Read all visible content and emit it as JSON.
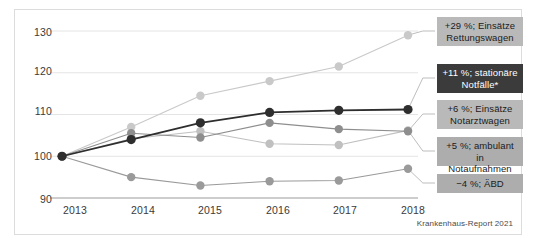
{
  "chart_data": {
    "type": "line",
    "title": "",
    "subtitle": "",
    "xlabel": "",
    "ylabel": "",
    "categories": [
      "2013",
      "2014",
      "2015",
      "2016",
      "2017",
      "2018"
    ],
    "x": [
      2013,
      2014,
      2015,
      2016,
      2017,
      2018
    ],
    "ylim": [
      90,
      130
    ],
    "yticks": [
      "90",
      "100",
      "110",
      "120",
      "130"
    ],
    "ytick_values": [
      90,
      100,
      110,
      120,
      130
    ],
    "grid": "horizontal",
    "legend_position": "right-inline-callouts",
    "index_base": 100,
    "series": [
      {
        "name": "Einsätze Rettungswagen",
        "values": [
          100,
          107,
          114.5,
          118,
          121.5,
          129
        ],
        "color": "#c9c9c9",
        "change_label": "+29 %; Einsätze\nRettungswagen"
      },
      {
        "name": "stationäre Notfälle*",
        "values": [
          100,
          104,
          108,
          110.5,
          111,
          111.2
        ],
        "color": "#2e2e2e",
        "change_label": "+11 %; stationäre\nNotfälle*"
      },
      {
        "name": "Einsätze Notarztwagen",
        "values": [
          100,
          105.5,
          104.5,
          108,
          106.5,
          106
        ],
        "color": "#8e8e8e",
        "change_label": "+6 %; Einsätze\nNotarztwagen"
      },
      {
        "name": "ambulant in Notaufnahmen",
        "values": [
          100,
          104.2,
          106,
          103,
          102.7,
          106.2
        ],
        "color": "#c0c0c0",
        "change_label": "+5 %; ambulant in\nNotaufnahmen"
      },
      {
        "name": "ÄBD",
        "values": [
          100,
          95,
          93,
          94,
          94.2,
          97
        ],
        "color": "#9a9a9a",
        "change_label": "−4 %; ÄBD"
      }
    ],
    "annotations": [
      {
        "id": "callout-rettungswagen",
        "text": "+29 %; Einsätze\nRettungswagen",
        "style": "light"
      },
      {
        "id": "callout-stationaere-notfaelle",
        "text": "+11 %; stationäre\nNotfälle*",
        "style": "dark"
      },
      {
        "id": "callout-notarztwagen",
        "text": "+6 %; Einsätze\nNotarztwagen",
        "style": "light"
      },
      {
        "id": "callout-ambulant-notaufnahmen",
        "text": "+5 %; ambulant in\nNotaufnahmen",
        "style": "mid"
      },
      {
        "id": "callout-aebd",
        "text": "−4 %; ÄBD",
        "style": "mid"
      }
    ],
    "source": "Krankenhaus-Report 2021"
  },
  "axis": {
    "y_labels": [
      "130",
      "120",
      "110",
      "100",
      "90"
    ],
    "x_labels": [
      "2013",
      "2014",
      "2015",
      "2016",
      "2017",
      "2018"
    ]
  },
  "source_note": "Krankenhaus-Report 2021",
  "colors": {
    "frame": "#dcdcdc",
    "grid": "#e4e4e4",
    "axis": "#9b9b9b",
    "callout_light": "#b9b9b9",
    "callout_mid": "#adadad",
    "callout_dark": "#3b3b3b",
    "text": "#1b1b1b"
  }
}
